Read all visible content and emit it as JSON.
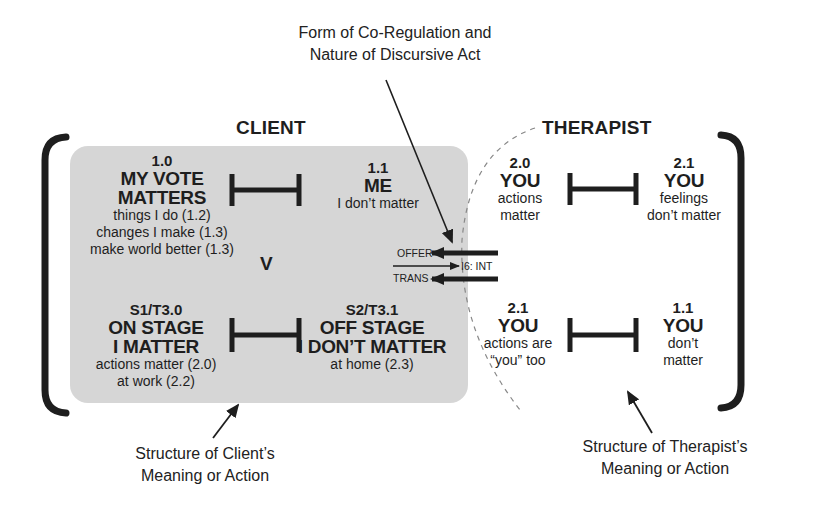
{
  "top_annotation": {
    "line1": "Form of Co-Regulation and",
    "line2": "Nature of Discursive Act"
  },
  "client": {
    "heading": "CLIENT",
    "top_left": {
      "code": "1.0",
      "title_line1": "MY VOTE",
      "title_line2": "MATTERS",
      "details": [
        "things I do (1.2)",
        "changes I make (1.3)",
        "make world better (1.3)"
      ]
    },
    "top_right": {
      "code": "1.1",
      "title_line1": "ME",
      "details": [
        "I don’t  matter"
      ]
    },
    "versus_label": "V",
    "bottom_left": {
      "code": "S1/T3.0",
      "title_line1": "ON STAGE",
      "title_line2": "I MATTER",
      "details": [
        "actions matter (2.0)",
        "at work (2.2)"
      ]
    },
    "bottom_right": {
      "code": "S2/T3.1",
      "title_line1": "OFF STAGE",
      "title_line2": "I DON’T MATTER",
      "details": [
        "at home (2.3)"
      ]
    }
  },
  "therapist": {
    "heading": "THERAPIST",
    "top_left": {
      "code": "2.0",
      "title_line1": "YOU",
      "details": [
        "actions",
        "matter"
      ]
    },
    "top_right": {
      "code": "2.1",
      "title_line1": "YOU",
      "details": [
        "feelings",
        "don’t matter"
      ]
    },
    "bottom_left": {
      "code": "2.1",
      "title_line1": "YOU",
      "details": [
        "actions are",
        "“you” too"
      ]
    },
    "bottom_right": {
      "code": "1.1",
      "title_line1": "YOU",
      "details": [
        "don’t",
        "matter"
      ]
    }
  },
  "exchange": {
    "offer_label": "OFFER",
    "trans_label": "TRANS",
    "int_label": "I6: INT"
  },
  "bottom_annotations": {
    "client": {
      "line1": "Structure of Client’s",
      "line2": "Meaning or Action"
    },
    "therapist": {
      "line1": "Structure of Therapist’s",
      "line2": "Meaning or Action"
    }
  },
  "colors": {
    "client_box": "#d6d6d6",
    "ink": "#1e1e1e"
  }
}
